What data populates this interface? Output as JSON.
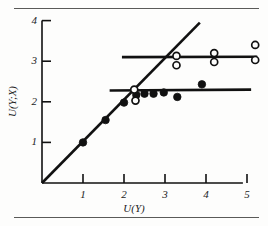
{
  "figure": {
    "kind": "scatter-plot-figure",
    "background_color": "#fdfdfc",
    "rule_color": "#5a5a58",
    "ink_color": "#111111"
  },
  "chart_data": {
    "type": "scatter",
    "title": "",
    "subtitle": "",
    "xlabel": "U(Y)",
    "ylabel": "U(Y;X)",
    "xlim": [
      0,
      5.5
    ],
    "ylim": [
      0,
      4.2
    ],
    "xticks": [
      1,
      2,
      3,
      4,
      5
    ],
    "yticks": [
      1,
      2,
      3,
      4
    ],
    "xtick_labels": [
      "1",
      "2",
      "3",
      "4",
      "5"
    ],
    "ytick_labels": [
      "1",
      "2",
      "3",
      "4"
    ],
    "grid": false,
    "legend": null,
    "legend_position": "none",
    "series": [
      {
        "name": "filled-circles",
        "marker": "filled-circle",
        "marker_color": "#111111",
        "marker_size": 7.5,
        "points": [
          {
            "x": 1.0,
            "y": 1.0
          },
          {
            "x": 1.55,
            "y": 1.55
          },
          {
            "x": 2.0,
            "y": 1.98
          },
          {
            "x": 2.3,
            "y": 2.17
          },
          {
            "x": 2.5,
            "y": 2.2
          },
          {
            "x": 2.72,
            "y": 2.2
          },
          {
            "x": 2.97,
            "y": 2.23
          },
          {
            "x": 3.3,
            "y": 2.12
          },
          {
            "x": 3.9,
            "y": 2.43
          }
        ]
      },
      {
        "name": "open-circles",
        "marker": "open-circle",
        "marker_color": "#111111",
        "marker_size": 7.0,
        "points": [
          {
            "x": 2.25,
            "y": 2.3
          },
          {
            "x": 2.28,
            "y": 2.03
          },
          {
            "x": 3.28,
            "y": 3.13
          },
          {
            "x": 3.28,
            "y": 2.9
          },
          {
            "x": 4.2,
            "y": 3.2
          },
          {
            "x": 4.2,
            "y": 2.98
          },
          {
            "x": 5.2,
            "y": 3.4
          },
          {
            "x": 5.2,
            "y": 3.03
          }
        ]
      }
    ],
    "reference_lines": [
      {
        "name": "identity-diagonal",
        "style": "solid",
        "width": 2.6,
        "from": {
          "x": 0.0,
          "y": 0.0
        },
        "to": {
          "x": 3.85,
          "y": 3.95
        }
      },
      {
        "name": "lower-plateau-line",
        "style": "solid",
        "width": 2.6,
        "from": {
          "x": 1.65,
          "y": 2.28
        },
        "to": {
          "x": 5.1,
          "y": 2.3
        }
      },
      {
        "name": "upper-plateau-line",
        "style": "solid",
        "width": 2.6,
        "from": {
          "x": 1.95,
          "y": 3.1
        },
        "to": {
          "x": 5.25,
          "y": 3.11
        }
      }
    ]
  }
}
